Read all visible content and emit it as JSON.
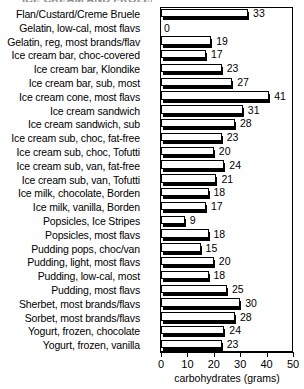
{
  "title_remnant": "ICE CREAM AND FROZEN",
  "chart_data": {
    "type": "bar",
    "orientation": "horizontal",
    "title": "",
    "xlabel": "carbohydrates (grams)",
    "ylabel": "",
    "xlim": [
      0,
      50
    ],
    "xticks": [
      0,
      10,
      20,
      30,
      40,
      50
    ],
    "xtick_labels": [
      "0",
      "10",
      "20",
      "30",
      "40",
      "50"
    ],
    "grid": false,
    "legend": false,
    "categories": [
      "Flan/Custard/Creme Bruele",
      "Gelatin, low-cal, most flavs",
      "Gelatin, reg, most brands/flav",
      "Ice cream bar, choc-covered",
      "Ice cream bar, Klondike",
      "Ice cream bar, sub, most",
      "Ice cream cone, most flavs",
      "Ice cream sandwich",
      "Ice cream sandwich, sub",
      "Ice cream sub, choc, fat-free",
      "Ice cream sub, choc, Tofutti",
      "Ice cream sub, van, fat-free",
      "Ice cream sub, van, Tofutti",
      "Ice milk, chocolate, Borden",
      "Ice milk, vanilla, Borden",
      "Popsicles, Ice Stripes",
      "Popsicles, most flavs",
      "Pudding pops, choc/van",
      "Pudding, light, most flavs",
      "Pudding, low-cal, most",
      "Pudding, most flavs",
      "Sherbet, most brands/flavs",
      "Sorbet, most brands/flavs",
      "Yogurt, frozen, chocolate",
      "Yogurt, frozen, vanilla"
    ],
    "values": [
      33,
      0,
      19,
      17,
      23,
      27,
      41,
      31,
      28,
      23,
      20,
      24,
      21,
      18,
      17,
      9,
      18,
      15,
      20,
      18,
      25,
      30,
      28,
      24,
      23
    ],
    "value_labels": [
      "33",
      "0",
      "19",
      "17",
      "23",
      "27",
      "41",
      "31",
      "28",
      "23",
      "20",
      "24",
      "21",
      "18",
      "17",
      "9",
      "18",
      "15",
      "20",
      "18",
      "25",
      "30",
      "28",
      "24",
      "23"
    ]
  },
  "colors": {
    "bar_fill": "#ffffff",
    "bar_outline": "#000000",
    "bar_shadow": "#000000",
    "background": "#ffffff",
    "text": "#000000"
  }
}
